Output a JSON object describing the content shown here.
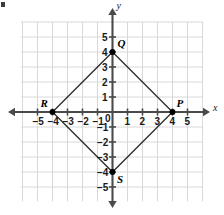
{
  "figure": {
    "axis_labels": {
      "x": "x",
      "y": "y"
    },
    "origin_label": "0",
    "colors": {
      "grid": "#d8d8d8",
      "axis": "#4a4a4a",
      "shape_stroke": "#2b2b2b",
      "vertex_dot": "#000000",
      "text": "#1a1a1a",
      "background": "#ffffff"
    }
  },
  "chart_data": {
    "type": "scatter",
    "xlabel": "x",
    "ylabel": "y",
    "xlim": [
      -6,
      6
    ],
    "ylim": [
      -6,
      6
    ],
    "grid": true,
    "legend": "none",
    "x_tick_labels": [
      "−5",
      "−4",
      "−3",
      "−2",
      "−1",
      "0",
      "1",
      "2",
      "3",
      "4",
      "5"
    ],
    "x_tick_values": [
      -5,
      -4,
      -3,
      -2,
      -1,
      0,
      1,
      2,
      3,
      4,
      5
    ],
    "y_tick_labels": [
      "5",
      "4",
      "3",
      "2",
      "1",
      "0",
      "−1",
      "−2",
      "−3",
      "−4",
      "−5"
    ],
    "y_tick_values": [
      5,
      4,
      3,
      2,
      1,
      0,
      -1,
      -2,
      -3,
      -4,
      -5
    ],
    "points": [
      {
        "name": "Q",
        "label": "Q",
        "x": 0,
        "y": 4
      },
      {
        "name": "P",
        "label": "P",
        "x": 4,
        "y": 0
      },
      {
        "name": "S",
        "label": "S",
        "x": 0,
        "y": -4
      },
      {
        "name": "R",
        "label": "R",
        "x": -4,
        "y": 0
      }
    ],
    "polygon": {
      "name": "PQRS",
      "closed": true,
      "vertices": [
        [
          0,
          4
        ],
        [
          4,
          0
        ],
        [
          0,
          -4
        ],
        [
          -4,
          0
        ]
      ]
    }
  }
}
